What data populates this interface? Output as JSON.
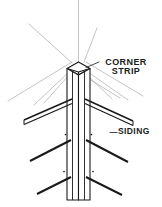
{
  "figure": {
    "type": "technical-line-drawing",
    "background_color": "#ffffff",
    "ink_color": "#1a1a1a",
    "construction_line_color": "#9a9a9a"
  },
  "labels": {
    "corner_strip": {
      "line1": "CORNER",
      "line2": "STRIP"
    },
    "siding": {
      "text": "SIDING"
    }
  },
  "elements": {
    "corner_strip_name": "corner-strip",
    "siding_name": "siding-boards",
    "nail_name": "nail-dot",
    "leader_name": "leader-line",
    "construction_name": "construction-line"
  }
}
